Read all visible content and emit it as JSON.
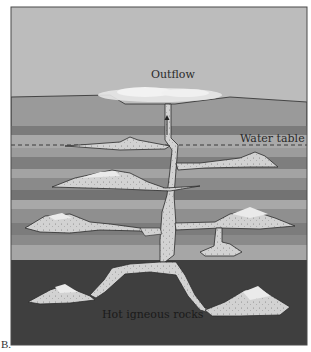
{
  "figure": {
    "panel_label": "B.",
    "labels": {
      "outflow": "Outflow",
      "water_table": "Water table",
      "hot_rocks": "Hot igneous rocks"
    },
    "colors": {
      "sky": "#b9b9b9",
      "layer_light": "#a7a7a7",
      "layer_mid": "#8e8e8e",
      "layer_dark": "#6f6f6f",
      "igneous": "#3e3e3e",
      "reservoir_fill": "#d2d2d2",
      "steam": "#ececec",
      "outline": "#2b2b2b"
    }
  }
}
